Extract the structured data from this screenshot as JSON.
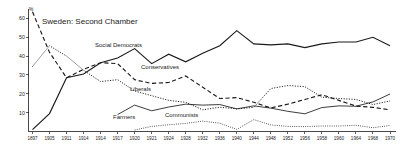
{
  "chart_data": {
    "type": "line",
    "title": "Sweden: Second Chamber",
    "xlabel": "",
    "ylabel": "%",
    "ylim": [
      0,
      65
    ],
    "yticks": [
      10,
      20,
      30,
      40,
      50,
      60
    ],
    "ytick_labels": [
      "10",
      "20",
      "30",
      "40",
      "50",
      "60"
    ],
    "grid": false,
    "legend_position": "inline-annotations",
    "x": [
      "1897",
      "1905",
      "1911",
      "1914",
      "1914b",
      "1917",
      "1920",
      "1921",
      "1924",
      "1928",
      "1932",
      "1936",
      "1940",
      "1944",
      "1948",
      "1952",
      "1956",
      "1958",
      "1960",
      "1964",
      "1968",
      "1970"
    ],
    "categories": [
      "1897",
      "1905",
      "1911",
      "1914",
      "1914b",
      "1917",
      "1920",
      "1921",
      "1924",
      "1928",
      "1932",
      "1936",
      "1940",
      "1944",
      "1948",
      "1952",
      "1956",
      "1958",
      "1960",
      "1964",
      "1968",
      "1970"
    ],
    "series": [
      {
        "name": "Social Democrats",
        "style": "solid",
        "values": [
          1,
          9.5,
          28.5,
          30.5,
          36.5,
          39.0,
          44.0,
          36.0,
          41.0,
          37.0,
          41.5,
          45.5,
          53.5,
          46.5,
          46.0,
          46.5,
          44.5,
          46.5,
          47.5,
          47.5,
          50.0,
          45.5
        ]
      },
      {
        "name": "Conservatives",
        "style": "dashed",
        "values": [
          63.5,
          42.0,
          28.5,
          33.0,
          36.5,
          36.0,
          27.5,
          25.5,
          26.0,
          29.5,
          23.5,
          17.5,
          18.0,
          15.5,
          12.5,
          14.5,
          17.0,
          19.5,
          16.5,
          13.5,
          12.8,
          11.5
        ]
      },
      {
        "name": "Liberals",
        "style": "dotted",
        "values": [
          34.5,
          45.5,
          40.0,
          32.5,
          26.5,
          27.5,
          21.5,
          19.0,
          16.5,
          15.5,
          11.5,
          12.9,
          12.0,
          12.8,
          22.8,
          24.4,
          23.8,
          18.2,
          17.5,
          17.0,
          14.3,
          16.2
        ]
      },
      {
        "name": "Farmers",
        "style": "thin",
        "values": [
          null,
          null,
          null,
          null,
          null,
          9.0,
          14.0,
          11.0,
          13.0,
          14.5,
          14.0,
          14.3,
          12.0,
          13.6,
          12.4,
          10.7,
          9.4,
          12.7,
          13.6,
          13.4,
          15.7,
          19.9
        ]
      },
      {
        "name": "Communists",
        "style": "fine",
        "values": [
          null,
          null,
          null,
          null,
          null,
          null,
          0.8,
          2.7,
          3.6,
          4.3,
          5.5,
          4.4,
          1.1,
          6.3,
          3.5,
          2.7,
          2.6,
          2.9,
          2.9,
          3.3,
          2.0,
          3.2
        ]
      }
    ],
    "annotations": [
      {
        "name": "Social Democrats",
        "x": 95,
        "y": 47
      },
      {
        "name": "Conservatives",
        "x": 141,
        "y": 69
      },
      {
        "name": "Liberals",
        "x": 130,
        "y": 91
      },
      {
        "name": "Farmers",
        "x": 113,
        "y": 119
      },
      {
        "name": "Communists",
        "x": 165,
        "y": 117
      }
    ],
    "colors": {
      "ink": "#1a1a1a",
      "background": "#ffffff"
    }
  }
}
